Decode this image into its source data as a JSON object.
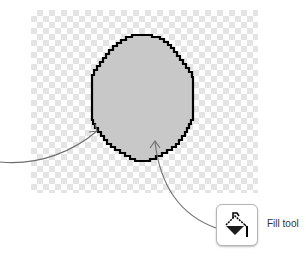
{
  "canvas": {
    "background": "transparency-checkerboard",
    "shape": {
      "type": "pixel-ellipse",
      "outline_color": "#000000",
      "fill_color": "#c8c8c8"
    }
  },
  "callouts": [
    {
      "target": "ellipse-outline",
      "from": "left-edge"
    },
    {
      "target": "ellipse-interior",
      "from": "fill-tool-button"
    }
  ],
  "tool": {
    "icon": "paint-bucket-icon",
    "label": "Fill tool"
  },
  "colors": {
    "arrow": "#6e6e6e",
    "checker": "#e4e4e4"
  }
}
